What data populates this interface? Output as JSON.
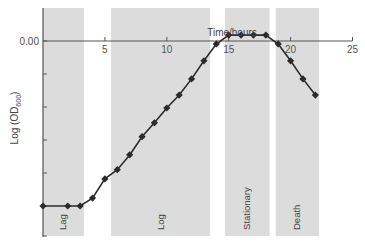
{
  "chart_data": {
    "type": "line",
    "title": "",
    "xlabel": "Time/hours",
    "ylabel": "Log (OD600)",
    "ylabel_main": "Log (OD",
    "ylabel_sub": "600",
    "ylabel_close": ")",
    "xlim": [
      0,
      25
    ],
    "x_ticks": [
      5,
      10,
      15,
      20,
      25
    ],
    "y_tick_label": "0.00",
    "grid": false,
    "legend": null,
    "series": [
      {
        "name": "Bacterial growth curve",
        "x": [
          0,
          2,
          3,
          4,
          5,
          6,
          7,
          8,
          9,
          10,
          11,
          12,
          13,
          14,
          15,
          16,
          17,
          18,
          19,
          20,
          21,
          22
        ],
        "y": [
          -5.0,
          -5.0,
          -5.0,
          -4.76,
          -4.18,
          -3.9,
          -3.45,
          -2.9,
          -2.48,
          -2.03,
          -1.64,
          -1.15,
          -0.6,
          -0.09,
          0.18,
          0.18,
          0.18,
          0.18,
          -0.09,
          -0.6,
          -1.15,
          -1.64
        ]
      }
    ],
    "phases": [
      {
        "label": "Lag",
        "x_start": 0,
        "x_end": 3.3
      },
      {
        "label": "Log",
        "x_start": 5.5,
        "x_end": 13.5
      },
      {
        "label": "Stationary",
        "x_start": 14.7,
        "x_end": 18.3
      },
      {
        "label": "Death",
        "x_start": 18.8,
        "x_end": 22.3
      }
    ],
    "colors": {
      "phase_fill": "#dcdcdc",
      "line": "#2b2b2b",
      "axis": "#555555"
    }
  }
}
